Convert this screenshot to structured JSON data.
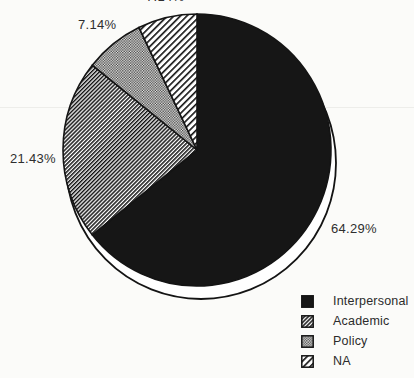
{
  "chart_data": {
    "type": "pie",
    "title": "",
    "start_angle_deg": 0,
    "direction": "clockwise",
    "legend_position": "bottom-right",
    "slices": [
      {
        "label": "Interpersonal",
        "value": 64.29,
        "display": "64.29%",
        "fill": "#161616",
        "pattern_name": "solid-black"
      },
      {
        "label": "Academic",
        "value": 21.43,
        "display": "21.43%",
        "fill": "pattern:academic",
        "pattern_name": "fine-diagonal-hatch"
      },
      {
        "label": "Policy",
        "value": 7.14,
        "display": "7.14%",
        "fill": "pattern:policy",
        "pattern_name": "gray-dot-screen"
      },
      {
        "label": "NA",
        "value": 7.14,
        "display": "7.14%",
        "fill": "pattern:na",
        "pattern_name": "wide-diagonal-hatch"
      }
    ],
    "colors": {
      "outline": "#141414",
      "background": "#fbfbf9",
      "label_text": "#2e2e2e"
    }
  }
}
